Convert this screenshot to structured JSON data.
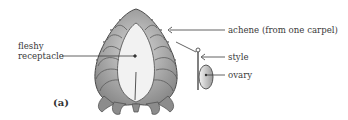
{
  "diagram": {
    "panel_label": "(a)",
    "labels": {
      "fleshy_receptacle_line1": "fleshy",
      "fleshy_receptacle_line2": "receptacle",
      "achene": "achene (from one carpel)",
      "style": "style",
      "ovary": "ovary"
    },
    "colors": {
      "outline": "#4a4a4a",
      "shading": "#9a9a9a",
      "receptacle_fill": "#f2f2f2",
      "text": "#3a3a3a"
    }
  }
}
